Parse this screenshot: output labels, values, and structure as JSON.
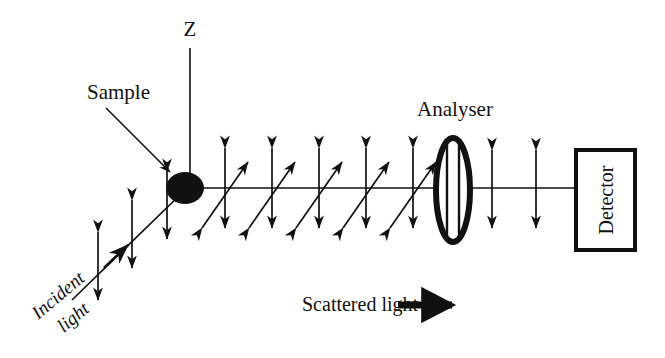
{
  "figure": {
    "title_text": "",
    "background_color": "#ffffff",
    "ink_color": "#111111",
    "width": 665,
    "height": 358
  },
  "labels": {
    "z_axis": "Z",
    "sample": "Sample",
    "analyser": "Analyser",
    "detector": "Detector",
    "incident_light_line1": "Incident",
    "incident_light_line2": "light",
    "scattered_light": "Scattered light"
  },
  "optics": {
    "beam_axis_y": 188,
    "z_axis_x": 190,
    "z_axis_top_y": 48,
    "sample": {
      "center_x": 185,
      "center_y": 188,
      "radius_x": 19,
      "radius_y": 16,
      "fill": "#111111"
    },
    "analyser": {
      "center_x": 453,
      "center_y": 190,
      "radius_x": 17,
      "radius_y": 52,
      "stroke_width": 6,
      "inner_line_offsets": [
        -6,
        6
      ]
    },
    "detector_box": {
      "x": 576,
      "y": 150,
      "width": 59,
      "height": 100,
      "stroke_width": 4,
      "text_rotation_deg": -90
    },
    "incident_beam": {
      "start_x": 72,
      "start_y": 300,
      "end_x": 182,
      "end_y": 192,
      "arrowhead_at_x": 118,
      "arrowhead_at_y": 254
    },
    "scattered_polarization_arrows_count": 5,
    "scattered_diagonal_arrows_count": 5,
    "post_analyser_arrows_count": 2,
    "incident_polarization_arrows_count": 3
  },
  "scattered_vertical_arrow_x": [
    225,
    272,
    319,
    366,
    413
  ],
  "scattered_diagonal_centers_x": [
    218,
    265,
    312,
    359,
    406
  ],
  "post_analyser_arrow_x": [
    492,
    536
  ],
  "incident_vertical_arrows": [
    {
      "x": 98,
      "cy": 265
    },
    {
      "x": 132,
      "cy": 234
    },
    {
      "x": 167,
      "cy": 205
    }
  ],
  "callouts": {
    "sample_arrow": {
      "x1": 106,
      "y1": 108,
      "x2": 170,
      "y2": 172
    },
    "scattered_arrow": {
      "x1": 398,
      "y1": 305,
      "x2": 460,
      "y2": 305,
      "thickness": 7
    }
  },
  "text_positions": {
    "z": {
      "x": 190,
      "y": 36,
      "size": 21
    },
    "sample": {
      "x": 87,
      "y": 99,
      "size": 21
    },
    "analyser": {
      "x": 455,
      "y": 116,
      "size": 21
    },
    "detector": {
      "x": 606,
      "y": 200,
      "size": 20
    },
    "incident_light": {
      "x": 62,
      "y": 300,
      "size": 19,
      "rotation_deg": -40
    },
    "scattered_light": {
      "x": 302,
      "y": 311,
      "size": 20
    }
  }
}
